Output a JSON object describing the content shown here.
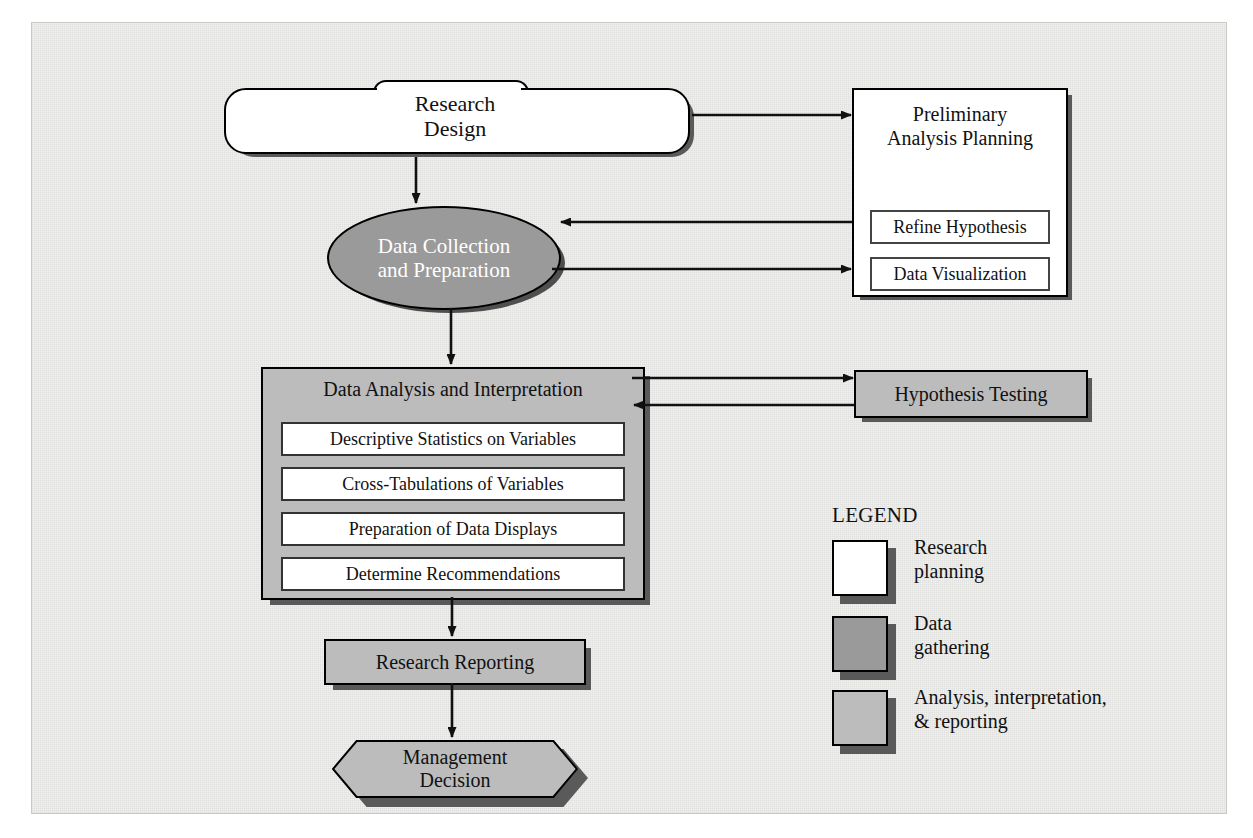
{
  "diagram": {
    "colors": {
      "background": "#f0f0ee",
      "white_fill": "#ffffff",
      "medium_gray": "#9a9a9a",
      "light_gray": "#bcbcbc",
      "shadow": "#5a5a5a",
      "outline": "#000000"
    },
    "nodes": {
      "research_design": {
        "label": "Research\nDesign",
        "category": "Research planning",
        "shape": "folder-rounded"
      },
      "preliminary_analysis": {
        "label": "Preliminary\nAnalysis Planning",
        "category": "Research planning",
        "shape": "rectangle",
        "subitems": [
          "Refine Hypothesis",
          "Data Visualization"
        ]
      },
      "data_collection": {
        "label": "Data Collection\nand Preparation",
        "category": "Data gathering",
        "shape": "ellipse"
      },
      "data_analysis": {
        "label": "Data Analysis and Interpretation",
        "category": "Analysis, interpretation, & reporting",
        "shape": "rectangle",
        "subitems": [
          "Descriptive Statistics on Variables",
          "Cross-Tabulations of Variables",
          "Preparation of Data Displays",
          "Determine Recommendations"
        ]
      },
      "hypothesis_testing": {
        "label": "Hypothesis Testing",
        "category": "Analysis, interpretation, & reporting",
        "shape": "rectangle"
      },
      "research_reporting": {
        "label": "Research Reporting",
        "category": "Analysis, interpretation, & reporting",
        "shape": "rectangle"
      },
      "management_decision": {
        "label": "Management\nDecision",
        "category": "Analysis, interpretation, & reporting",
        "shape": "hexagon"
      }
    },
    "connections": [
      {
        "from": "research_design",
        "to": "data_collection",
        "direction": "down"
      },
      {
        "from": "research_design",
        "to": "preliminary_analysis",
        "direction": "right"
      },
      {
        "from": "preliminary_analysis",
        "to": "data_collection",
        "direction": "left"
      },
      {
        "from": "data_collection",
        "to": "preliminary_analysis",
        "direction": "right"
      },
      {
        "from": "data_collection",
        "to": "data_analysis",
        "direction": "down"
      },
      {
        "from": "data_analysis",
        "to": "hypothesis_testing",
        "direction": "right"
      },
      {
        "from": "hypothesis_testing",
        "to": "data_analysis",
        "direction": "left"
      },
      {
        "from": "data_analysis",
        "to": "research_reporting",
        "direction": "down"
      },
      {
        "from": "research_reporting",
        "to": "management_decision",
        "direction": "down"
      }
    ],
    "legend": {
      "title": "LEGEND",
      "items": [
        {
          "label": "Research\nplanning",
          "color": "#ffffff"
        },
        {
          "label": "Data\ngathering",
          "color": "#9a9a9a"
        },
        {
          "label": "Analysis, interpretation,\n& reporting",
          "color": "#bcbcbc"
        }
      ]
    }
  }
}
